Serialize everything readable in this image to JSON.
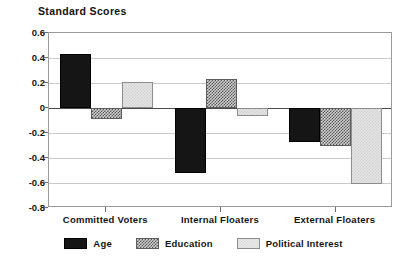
{
  "chart_data": {
    "type": "bar",
    "title": "Standard Scores",
    "xlabel": "",
    "ylabel": "",
    "ylim": [
      -0.8,
      0.6
    ],
    "yticks": [
      0.6,
      0.4,
      0.2,
      0,
      -0.2,
      -0.4,
      -0.6,
      -0.8
    ],
    "ytick_labels": [
      "0.6",
      "0.4",
      "0.2",
      "0",
      "-0.2",
      "-0.4",
      "-0.6",
      "-0.8"
    ],
    "grid": true,
    "legend_position": "bottom",
    "categories": [
      "Committed Voters",
      "Internal Floaters",
      "External Floaters"
    ],
    "series": [
      {
        "name": "Age",
        "key": "age",
        "color": "#151515",
        "pattern": "solid-black",
        "values": [
          0.43,
          -0.52,
          -0.27
        ]
      },
      {
        "name": "Education",
        "key": "education",
        "color": "#5d5d5d",
        "pattern": "checkerboard-dark",
        "values": [
          -0.09,
          0.23,
          -0.3
        ]
      },
      {
        "name": "Political Interest",
        "key": "political",
        "color": "#e4e4e4",
        "pattern": "checkerboard-light",
        "values": [
          0.205,
          -0.06,
          -0.61
        ]
      }
    ]
  },
  "legend": {
    "items": [
      {
        "label": "Age",
        "key": "age"
      },
      {
        "label": "Education",
        "key": "education"
      },
      {
        "label": "Political Interest",
        "key": "political"
      }
    ]
  }
}
